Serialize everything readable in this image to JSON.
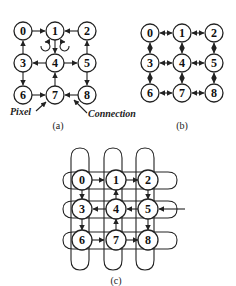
{
  "figure": {
    "panels": [
      {
        "id": "a",
        "caption": "(a)",
        "nodes": [
          "0",
          "1",
          "2",
          "3",
          "4",
          "5",
          "6",
          "7",
          "8"
        ],
        "annotations": {
          "pixel_label": "Pixel",
          "connection_label": "Connection"
        },
        "edges_directed": [
          [
            "0",
            "1"
          ],
          [
            "2",
            "1"
          ],
          [
            "1",
            "4"
          ],
          [
            "3",
            "0"
          ],
          [
            "5",
            "2"
          ],
          [
            "4",
            "3"
          ],
          [
            "4",
            "5"
          ],
          [
            "3",
            "6"
          ],
          [
            "5",
            "8"
          ],
          [
            "7",
            "4"
          ],
          [
            "6",
            "7"
          ],
          [
            "8",
            "7"
          ]
        ],
        "rotation_markers": [
          "counterclockwise",
          "clockwise"
        ]
      },
      {
        "id": "b",
        "caption": "(b)",
        "nodes": [
          "0",
          "1",
          "2",
          "3",
          "4",
          "5",
          "6",
          "7",
          "8"
        ],
        "edges": "bidirectional 4-neighbor grid"
      },
      {
        "id": "c",
        "caption": "(c)",
        "nodes": [
          "0",
          "1",
          "2",
          "3",
          "4",
          "5",
          "6",
          "7",
          "8"
        ],
        "edges": "toroidal wrap-around loops on rows and columns"
      }
    ]
  }
}
